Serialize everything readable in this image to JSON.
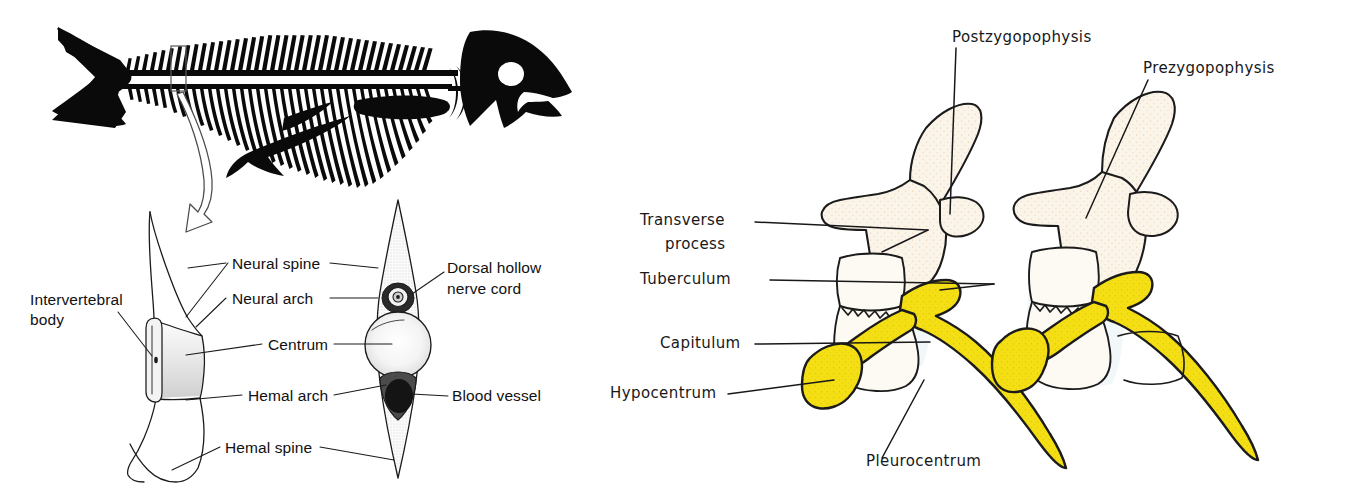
{
  "figure": {
    "background_color": "#ffffff",
    "panels": [
      {
        "id": "left",
        "name": "teleost-vertebra-diagram",
        "style": "printed line drawing"
      },
      {
        "id": "right",
        "name": "rhachitomous-vertebrae-sketch",
        "style": "hand-drawn annotated sketch"
      }
    ]
  },
  "left_panel": {
    "name": "fish-skeleton-and-vertebra",
    "fish": {
      "name": "fish-skeleton-silhouette",
      "eye": "white-eye-dot",
      "callout_box": "vertebra-highlight-box",
      "arrow": "magnify-arrow"
    },
    "views": {
      "lateral": "lateral-vertebra-view",
      "anterior": "anterior-vertebra-view"
    },
    "labels": [
      {
        "id": "intervertebral-body",
        "text": "Intervertebral",
        "text2": "body",
        "x": 30,
        "y": 305,
        "anchor": "start"
      },
      {
        "id": "neural-spine",
        "text": "Neural spine",
        "x": 232,
        "y": 268,
        "anchor": "start"
      },
      {
        "id": "neural-arch",
        "text": "Neural  arch",
        "x": 232,
        "y": 303,
        "anchor": "start"
      },
      {
        "id": "centrum",
        "text": "Centrum",
        "x": 268,
        "y": 349,
        "anchor": "start"
      },
      {
        "id": "hemal-arch",
        "text": "Hemal arch",
        "x": 248,
        "y": 400,
        "anchor": "start"
      },
      {
        "id": "hemal-spine",
        "text": "Hemal  spine",
        "x": 225,
        "y": 452,
        "anchor": "start"
      },
      {
        "id": "dorsal-hollow-nerve-cord",
        "text": "Dorsal hollow",
        "text2": "nerve cord",
        "x": 447,
        "y": 272,
        "anchor": "start"
      },
      {
        "id": "blood-vessel",
        "text": "Blood vessel",
        "x": 452,
        "y": 400,
        "anchor": "start"
      }
    ]
  },
  "right_panel": {
    "name": "hand-drawn-vertebrae",
    "colors": {
      "rib_yellow": "#f3df13",
      "rib_yellow_shade": "#e8b616",
      "bone_cream": "#fbf4e9",
      "bone_speckle": "#d9a273",
      "ink": "#18181a",
      "wash_blue": "#e9f1f6"
    },
    "labels": [
      {
        "id": "postzygopophysis",
        "text": "Postzygopophysis",
        "x": 952,
        "y": 42,
        "anchor": "start"
      },
      {
        "id": "prezygopophysis",
        "text": "Prezygopophysis",
        "x": 1143,
        "y": 73,
        "anchor": "start"
      },
      {
        "id": "transverse-process",
        "text": "Transverse",
        "text2": "process",
        "x": 640,
        "y": 225,
        "anchor": "start"
      },
      {
        "id": "tuberculum",
        "text": "Tuberculum",
        "x": 640,
        "y": 284,
        "anchor": "start"
      },
      {
        "id": "capitulum",
        "text": "Capitulum",
        "x": 660,
        "y": 348,
        "anchor": "start"
      },
      {
        "id": "hypocentrum",
        "text": "Hypocentrum",
        "x": 604,
        "y": 397,
        "anchor": "start"
      },
      {
        "id": "pleurocentrum",
        "text": "Pleurocentrum",
        "x": 866,
        "y": 466,
        "anchor": "start"
      }
    ]
  }
}
